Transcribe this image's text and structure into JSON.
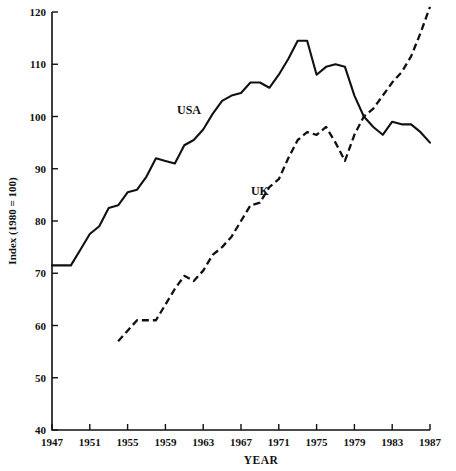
{
  "chart_data": {
    "type": "line",
    "title": "",
    "xlabel": "YEAR",
    "ylabel": "Index  (1980 = 100)",
    "xlim": [
      1947,
      1987
    ],
    "ylim": [
      40,
      120
    ],
    "grid": false,
    "legend_position": "inline-annotations",
    "xticks": [
      1947,
      1951,
      1955,
      1959,
      1963,
      1967,
      1971,
      1975,
      1979,
      1983,
      1987
    ],
    "xticklabels": [
      "1947",
      "1951",
      "1955",
      "1959",
      "1963",
      "1967",
      "1971",
      "1975",
      "1979",
      "1983",
      "1987"
    ],
    "yticks": [
      40,
      50,
      60,
      70,
      80,
      90,
      100,
      110,
      120
    ],
    "yticklabels": [
      "40",
      "50",
      "60",
      "70",
      "80",
      "90",
      "100",
      "110",
      "120"
    ],
    "annotations": [
      {
        "text": "USA",
        "x": 1961.5,
        "y": 100.5
      },
      {
        "text": "UK",
        "x": 1969.0,
        "y": 85.0
      }
    ],
    "series": [
      {
        "name": "USA",
        "style": "solid",
        "x": [
          1947,
          1948,
          1949,
          1950,
          1951,
          1952,
          1953,
          1954,
          1955,
          1956,
          1957,
          1958,
          1959,
          1960,
          1961,
          1962,
          1963,
          1964,
          1965,
          1966,
          1967,
          1968,
          1969,
          1970,
          1971,
          1972,
          1973,
          1974,
          1975,
          1976,
          1977,
          1978,
          1979,
          1980,
          1981,
          1982,
          1983,
          1984,
          1985,
          1986,
          1987
        ],
        "values": [
          71.5,
          71.5,
          71.5,
          74.5,
          77.5,
          79.0,
          82.5,
          83.0,
          85.5,
          86.0,
          88.5,
          92.0,
          91.5,
          91.0,
          94.5,
          95.5,
          97.5,
          100.5,
          103.0,
          104.0,
          104.5,
          106.5,
          106.5,
          105.5,
          108.0,
          111.0,
          114.5,
          114.5,
          108.0,
          109.5,
          110.0,
          109.5,
          104.0,
          100.0,
          98.0,
          96.5,
          99.0,
          98.5,
          98.5,
          97.0,
          95.0
        ]
      },
      {
        "name": "UK",
        "style": "dashed",
        "x": [
          1954,
          1955,
          1956,
          1957,
          1958,
          1959,
          1960,
          1961,
          1962,
          1963,
          1964,
          1965,
          1966,
          1967,
          1968,
          1969,
          1970,
          1971,
          1972,
          1973,
          1974,
          1975,
          1976,
          1977,
          1978,
          1979,
          1980,
          1981,
          1982,
          1983,
          1984,
          1985,
          1986,
          1987
        ],
        "values": [
          57.0,
          59.0,
          61.0,
          61.0,
          61.0,
          64.0,
          67.0,
          69.5,
          68.5,
          70.5,
          73.5,
          75.0,
          77.0,
          80.0,
          83.0,
          83.5,
          86.5,
          88.0,
          92.0,
          95.5,
          97.0,
          96.5,
          98.0,
          95.0,
          91.5,
          96.5,
          100.0,
          101.5,
          104.0,
          106.5,
          108.5,
          111.5,
          116.0,
          121.0
        ]
      }
    ]
  }
}
